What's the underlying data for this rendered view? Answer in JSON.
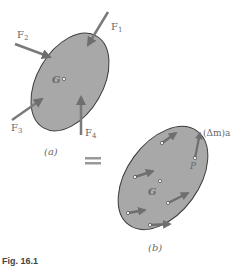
{
  "figure": {
    "caption": "Fig. 16.1",
    "equals_sign": "="
  },
  "panel_a": {
    "label": "(a)",
    "center_label": "G",
    "forces": [
      {
        "name": "F1",
        "base": "F",
        "sub": "1"
      },
      {
        "name": "F2",
        "base": "F",
        "sub": "2"
      },
      {
        "name": "F3",
        "base": "F",
        "sub": "3"
      },
      {
        "name": "F4",
        "base": "F",
        "sub": "4"
      }
    ]
  },
  "panel_b": {
    "label": "(b)",
    "center_label": "G",
    "point_label": "P",
    "inertia_label": "(Δm)a"
  },
  "colors": {
    "body_fill": "#a8a8a8",
    "body_stroke": "#3a3a3a",
    "arrow": "#7a7a7a",
    "equals": "#9a9a9a",
    "text": "#6a6a6a"
  }
}
